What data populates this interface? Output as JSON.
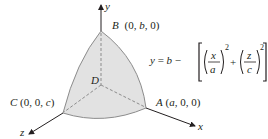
{
  "diagram": {
    "axes": {
      "x": "x",
      "y": "y",
      "z": "z"
    },
    "points": {
      "A": {
        "name": "A",
        "coords": "(a, 0, 0)"
      },
      "B": {
        "name": "B",
        "coords": "(0, b, 0)"
      },
      "C": {
        "name": "C",
        "coords": "(0, 0, c)"
      },
      "D": {
        "name": "D"
      }
    },
    "equation": {
      "lhs": "y = b −",
      "term1_num": "x",
      "term1_den": "a",
      "term2_num": "z",
      "term2_den": "c",
      "exponent": "2",
      "plus": "+"
    },
    "colors": {
      "surface_fill": "#e2e2e2",
      "surface_edge": "#8c8c8c",
      "axis": "#231f20",
      "hidden_line": "#8c8c8c"
    }
  }
}
